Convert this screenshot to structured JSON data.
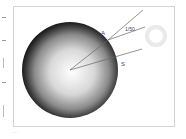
{
  "diagram": {
    "labels": {
      "point_a": "A",
      "ratio": "1/50",
      "point_s": "S"
    },
    "elements": {
      "sphere": "limb-darkened-sphere",
      "halo": "bright-ring"
    }
  },
  "caption": "..."
}
